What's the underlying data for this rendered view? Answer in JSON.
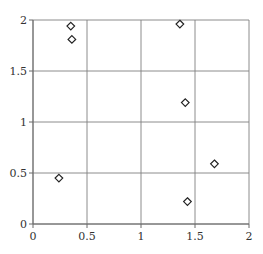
{
  "chart_data": {
    "type": "scatter",
    "title": "",
    "xlabel": "",
    "ylabel": "",
    "xlim": [
      0,
      2
    ],
    "ylim": [
      0,
      2
    ],
    "grid": true,
    "legend": null,
    "marker": "diamond-open",
    "x_ticks": [
      0,
      0.5,
      1,
      1.5,
      2
    ],
    "y_ticks": [
      0,
      0.5,
      1,
      1.5,
      2
    ],
    "x_tick_labels": [
      "0",
      "0.5",
      "1",
      "1.5",
      "2"
    ],
    "y_tick_labels": [
      "0",
      "0.5",
      "1",
      "1.5",
      "2"
    ],
    "series": [
      {
        "name": "",
        "points": [
          {
            "x": 0.35,
            "y": 1.94
          },
          {
            "x": 0.36,
            "y": 1.81
          },
          {
            "x": 1.36,
            "y": 1.96
          },
          {
            "x": 1.41,
            "y": 1.19
          },
          {
            "x": 0.24,
            "y": 0.45
          },
          {
            "x": 1.68,
            "y": 0.59
          },
          {
            "x": 1.43,
            "y": 0.22
          }
        ]
      }
    ]
  },
  "style": {
    "grid_color": "#7f7f7f",
    "marker_stroke": "#222222",
    "marker_fill": "#ffffff",
    "background": "#ffffff"
  }
}
